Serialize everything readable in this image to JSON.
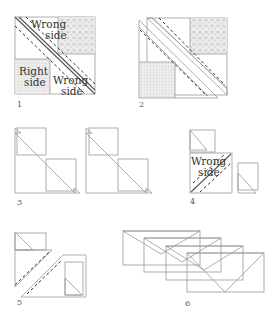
{
  "diagram": {
    "type": "quilting half-square triangle instructions",
    "steps": [
      {
        "number": "1",
        "labels": [
          "Wrong side",
          "Right side",
          "Wrong side"
        ]
      },
      {
        "number": "2",
        "labels": []
      },
      {
        "number": "3",
        "labels": []
      },
      {
        "number": "4",
        "labels": [
          "Wrong side"
        ]
      },
      {
        "number": "5",
        "labels": []
      },
      {
        "number": "6",
        "labels": []
      }
    ],
    "labels": {
      "wrong_side_1a": "Wrong",
      "wrong_side_1b": "side",
      "right_side_1a": "Right",
      "right_side_1b": "side",
      "wrong_side_2a": "Wrong",
      "wrong_side_2b": "side",
      "wrong_side_4a": "Wrong",
      "wrong_side_4b": "side"
    },
    "step_numbers": [
      "1",
      "2",
      "3",
      "4",
      "5",
      "6"
    ],
    "colors": {
      "outline": "#9a9a9a",
      "fabric_fill": "#e4e4e4",
      "print_fill": "#d6d6d6",
      "seam_line": "#555555",
      "dashed_line": "#333333"
    }
  }
}
